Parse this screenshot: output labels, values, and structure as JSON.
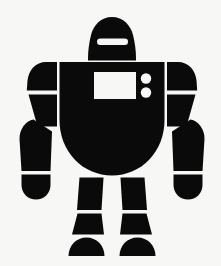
{
  "image": {
    "title": "Robot Silhouette Icon",
    "subject": "robot",
    "style": "solid black silhouette clip-art",
    "alt_text": "Black silhouette of a standing robot with a domed head, visor slot, rectangular chest panel, two round chest lights, segmented arms and legs",
    "canvas": {
      "width": 221,
      "height": 266,
      "background_color": "#f7f7f5",
      "ink_color": "#0a0a0a"
    },
    "parts": [
      {
        "name": "head",
        "label": "Head",
        "shape": "dome",
        "x": 88,
        "y": 17,
        "width": 48,
        "height": 44
      },
      {
        "name": "visor",
        "label": "Visor Slot",
        "shape": "rounded-bar",
        "x": 97,
        "y": 38,
        "width": 31,
        "height": 7,
        "color": "#f7f7f5"
      },
      {
        "name": "torso",
        "label": "Torso",
        "shape": "u-body",
        "x": 59,
        "y": 62,
        "width": 106,
        "height": 113
      },
      {
        "name": "chest-panel",
        "label": "Chest Panel",
        "shape": "rectangle",
        "x": 94,
        "y": 72,
        "width": 42,
        "height": 27,
        "color": "#f7f7f5"
      },
      {
        "name": "chest-light-upper",
        "label": "Upper Chest Light",
        "shape": "circle",
        "cx": 146,
        "cy": 78,
        "r": 5,
        "color": "#f7f7f5"
      },
      {
        "name": "chest-light-lower",
        "label": "Lower Chest Light",
        "shape": "circle",
        "cx": 146,
        "cy": 92,
        "r": 5,
        "color": "#f7f7f5"
      },
      {
        "name": "left-shoulder",
        "label": "Left Shoulder",
        "shape": "rounded-block",
        "x": 27,
        "y": 62,
        "width": 30,
        "height": 28
      },
      {
        "name": "left-upper-arm",
        "label": "Left Upper Arm",
        "shape": "wedge",
        "x": 27,
        "y": 93,
        "width": 30,
        "height": 32
      },
      {
        "name": "left-forearm",
        "label": "Left Forearm",
        "shape": "taper",
        "x": 19,
        "y": 118,
        "width": 33,
        "height": 53
      },
      {
        "name": "left-hand",
        "label": "Left Hand",
        "shape": "rounded-blob",
        "x": 20,
        "y": 174,
        "width": 28,
        "height": 25
      },
      {
        "name": "right-shoulder",
        "label": "Right Shoulder",
        "shape": "rounded-block",
        "x": 167,
        "y": 62,
        "width": 30,
        "height": 28
      },
      {
        "name": "right-upper-arm",
        "label": "Right Upper Arm",
        "shape": "wedge",
        "x": 167,
        "y": 93,
        "width": 30,
        "height": 32
      },
      {
        "name": "right-forearm",
        "label": "Right Forearm",
        "shape": "taper",
        "x": 172,
        "y": 118,
        "width": 33,
        "height": 53
      },
      {
        "name": "right-hand",
        "label": "Right Hand",
        "shape": "rounded-blob",
        "x": 176,
        "y": 174,
        "width": 28,
        "height": 25
      },
      {
        "name": "left-thigh",
        "label": "Left Thigh",
        "shape": "column",
        "x": 77,
        "y": 177,
        "width": 26,
        "height": 33
      },
      {
        "name": "left-shin",
        "label": "Left Shin",
        "shape": "trapezoid",
        "x": 72,
        "y": 213,
        "width": 36,
        "height": 22
      },
      {
        "name": "left-foot",
        "label": "Left Foot",
        "shape": "dome",
        "x": 68,
        "y": 238,
        "width": 37,
        "height": 18
      },
      {
        "name": "right-thigh",
        "label": "Right Thigh",
        "shape": "column",
        "x": 121,
        "y": 177,
        "width": 26,
        "height": 33
      },
      {
        "name": "right-shin",
        "label": "Right Shin",
        "shape": "trapezoid",
        "x": 116,
        "y": 213,
        "width": 36,
        "height": 22
      },
      {
        "name": "right-foot",
        "label": "Right Foot",
        "shape": "dome",
        "x": 119,
        "y": 238,
        "width": 37,
        "height": 18
      }
    ]
  }
}
